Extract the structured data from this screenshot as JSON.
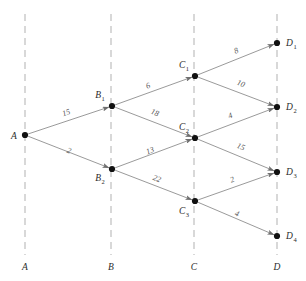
{
  "chart_data": {
    "type": "diagram",
    "title": "",
    "subtitle": "",
    "xlabel": "",
    "ylabel": "",
    "legend": [],
    "grid": false,
    "stages": [
      {
        "id": "A",
        "label": "A",
        "x": 25
      },
      {
        "id": "B",
        "label": "B",
        "x": 111
      },
      {
        "id": "C",
        "label": "C",
        "x": 194
      },
      {
        "id": "D",
        "label": "D",
        "x": 277
      }
    ],
    "nodes": [
      {
        "id": "A",
        "base": "A",
        "sub": "",
        "x": 25,
        "y": 135,
        "label_x": 14,
        "label_y": 139,
        "anchor": "middle"
      },
      {
        "id": "B1",
        "base": "B",
        "sub": "1",
        "x": 112,
        "y": 106,
        "label_x": 100,
        "label_y": 98,
        "anchor": "middle"
      },
      {
        "id": "B2",
        "base": "B",
        "sub": "2",
        "x": 112,
        "y": 169,
        "label_x": 100,
        "label_y": 181,
        "anchor": "middle"
      },
      {
        "id": "C1",
        "base": "C",
        "sub": "1",
        "x": 195,
        "y": 76,
        "label_x": 184,
        "label_y": 68,
        "anchor": "middle"
      },
      {
        "id": "C2",
        "base": "C",
        "sub": "2",
        "x": 195,
        "y": 138,
        "label_x": 184,
        "label_y": 130,
        "anchor": "middle"
      },
      {
        "id": "C3",
        "base": "C",
        "sub": "3",
        "x": 195,
        "y": 201,
        "label_x": 184,
        "label_y": 214,
        "anchor": "middle"
      },
      {
        "id": "D1",
        "base": "D",
        "sub": "1",
        "x": 277,
        "y": 43,
        "label_x": 286,
        "label_y": 46,
        "anchor": "start"
      },
      {
        "id": "D2",
        "base": "D",
        "sub": "2",
        "x": 277,
        "y": 107,
        "label_x": 286,
        "label_y": 110,
        "anchor": "start"
      },
      {
        "id": "D3",
        "base": "D",
        "sub": "3",
        "x": 277,
        "y": 172,
        "label_x": 286,
        "label_y": 175,
        "anchor": "start"
      },
      {
        "id": "D4",
        "base": "D",
        "sub": "4",
        "x": 277,
        "y": 236,
        "label_x": 286,
        "label_y": 239,
        "anchor": "start"
      }
    ],
    "edges": [
      {
        "from": "A",
        "to": "B1",
        "weight": 15,
        "label_x": 67,
        "label_y": 115,
        "rotate": -19
      },
      {
        "from": "A",
        "to": "B2",
        "weight": 2,
        "label_x": 68,
        "label_y": 153,
        "rotate": 21
      },
      {
        "from": "B1",
        "to": "C1",
        "weight": 6,
        "label_x": 149,
        "label_y": 88,
        "rotate": -20
      },
      {
        "from": "B1",
        "to": "C2",
        "weight": 18,
        "label_x": 154,
        "label_y": 115,
        "rotate": 21
      },
      {
        "from": "B2",
        "to": "C2",
        "weight": 13,
        "label_x": 151,
        "label_y": 153,
        "rotate": -21
      },
      {
        "from": "B2",
        "to": "C3",
        "weight": 22,
        "label_x": 156,
        "label_y": 181,
        "rotate": 21
      },
      {
        "from": "C1",
        "to": "D1",
        "weight": 8,
        "label_x": 237,
        "label_y": 53,
        "rotate": -22
      },
      {
        "from": "C1",
        "to": "D2",
        "weight": 10,
        "label_x": 240,
        "label_y": 86,
        "rotate": 21
      },
      {
        "from": "C2",
        "to": "D2",
        "weight": 4,
        "label_x": 231,
        "label_y": 118,
        "rotate": -21
      },
      {
        "from": "C2",
        "to": "D3",
        "weight": 15,
        "label_x": 240,
        "label_y": 149,
        "rotate": 22
      },
      {
        "from": "C3",
        "to": "D3",
        "weight": 2,
        "label_x": 233,
        "label_y": 182,
        "rotate": -21
      },
      {
        "from": "C3",
        "to": "D4",
        "weight": 4,
        "label_x": 236,
        "label_y": 216,
        "rotate": 21
      }
    ],
    "colors": {
      "node": "#111111",
      "edge": "#8e8e8e",
      "stage_line": "#b9b9b9",
      "text": "#3a3a3a",
      "background": "#ffffff"
    }
  }
}
